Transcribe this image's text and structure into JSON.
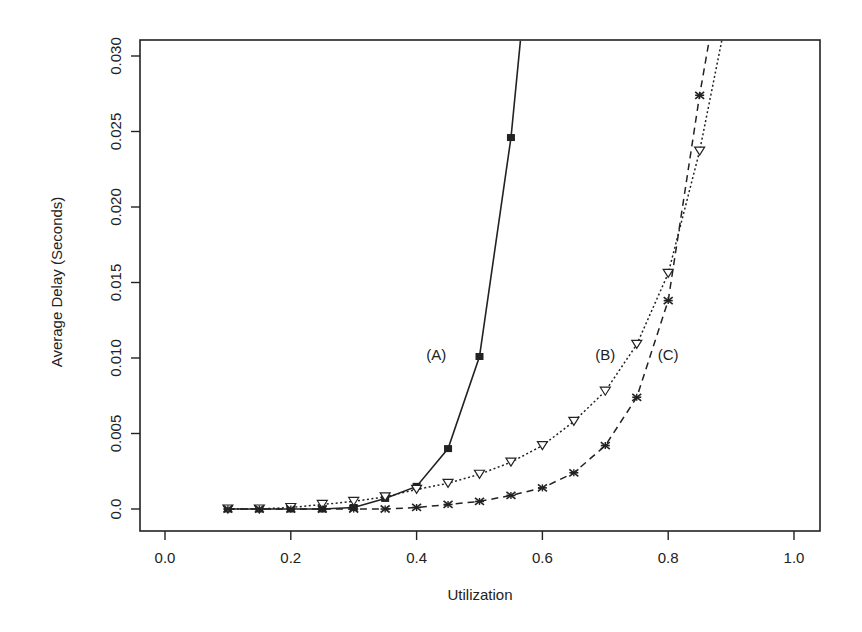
{
  "chart_data": {
    "type": "line",
    "title": "",
    "xlabel": "Utilization",
    "ylabel": "Average Delay (Seconds)",
    "xlim": [
      -0.04,
      1.04
    ],
    "ylim": [
      -0.0015,
      0.031
    ],
    "xticks": [
      0.0,
      0.2,
      0.4,
      0.6,
      0.8,
      1.0
    ],
    "xtick_labels": [
      "0.0",
      "0.2",
      "0.4",
      "0.6",
      "0.8",
      "1.0"
    ],
    "yticks": [
      0.0,
      0.005,
      0.01,
      0.015,
      0.02,
      0.025,
      0.03
    ],
    "ytick_labels": [
      "0.0",
      "0.005",
      "0.010",
      "0.015",
      "0.020",
      "0.025",
      "0.030"
    ],
    "grid": false,
    "legend": "none (inline labels)",
    "series": [
      {
        "name": "(A)",
        "marker": "filled-square",
        "line_style": "solid",
        "x": [
          0.1,
          0.15,
          0.2,
          0.25,
          0.3,
          0.35,
          0.4,
          0.45,
          0.5,
          0.55,
          0.565
        ],
        "y": [
          0.0,
          0.0,
          0.0,
          0.0,
          0.0001,
          0.0007,
          0.0015,
          0.004,
          0.0101,
          0.0246,
          0.031
        ],
        "marker_points": 10,
        "label_pos": {
          "x": 0.455,
          "y": 0.0102
        }
      },
      {
        "name": "(B)",
        "marker": "open-triangle-down",
        "line_style": "dotted",
        "x": [
          0.1,
          0.15,
          0.2,
          0.25,
          0.3,
          0.35,
          0.4,
          0.45,
          0.5,
          0.55,
          0.6,
          0.65,
          0.7,
          0.75,
          0.8,
          0.85,
          0.885
        ],
        "y": [
          0.0,
          0.0,
          0.0001,
          0.0003,
          0.0005,
          0.0008,
          0.0013,
          0.0017,
          0.0023,
          0.0031,
          0.0042,
          0.0058,
          0.0078,
          0.0109,
          0.0156,
          0.0237,
          0.031
        ],
        "marker_points": 16,
        "label_pos": {
          "x": 0.7,
          "y": 0.0102
        }
      },
      {
        "name": "(C)",
        "marker": "star",
        "line_style": "dashed",
        "x": [
          0.1,
          0.15,
          0.2,
          0.25,
          0.3,
          0.35,
          0.4,
          0.45,
          0.5,
          0.55,
          0.6,
          0.65,
          0.7,
          0.75,
          0.8,
          0.85,
          0.865
        ],
        "y": [
          0.0,
          0.0,
          0.0,
          0.0,
          0.0,
          0.0,
          0.0001,
          0.0003,
          0.0005,
          0.0009,
          0.0014,
          0.0024,
          0.0042,
          0.0074,
          0.0138,
          0.0274,
          0.031
        ],
        "marker_points": 16,
        "label_pos": {
          "x": 0.8,
          "y": 0.0102
        }
      }
    ]
  },
  "colors": {
    "ink": "#222222",
    "background": "#ffffff"
  }
}
